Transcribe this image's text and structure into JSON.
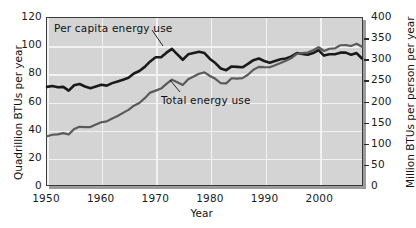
{
  "chart_data": {
    "type": "line",
    "title": "",
    "xlabel": "Year",
    "ylabel_left": "Quadrillion BTUs per year",
    "ylabel_right": "Million BTUs per person per year",
    "grid": true,
    "legend_position": "inline-annotations",
    "xlim": [
      1950,
      2008
    ],
    "xticks": [
      1950,
      1960,
      1970,
      1980,
      1990,
      2000
    ],
    "ylim_left": [
      0,
      120
    ],
    "yticks_left": [
      0,
      20,
      40,
      60,
      80,
      100,
      120
    ],
    "ylim_right": [
      0,
      400
    ],
    "yticks_right": [
      0,
      50,
      100,
      150,
      200,
      250,
      300,
      350,
      400
    ],
    "annotations": [
      {
        "text": "Per capita energy use",
        "series": "per_capita_energy_use"
      },
      {
        "text": "Total energy use",
        "series": "total_energy_use"
      }
    ],
    "x": [
      1950,
      1951,
      1952,
      1953,
      1954,
      1955,
      1956,
      1957,
      1958,
      1959,
      1960,
      1961,
      1962,
      1963,
      1964,
      1965,
      1966,
      1967,
      1968,
      1969,
      1970,
      1971,
      1972,
      1973,
      1974,
      1975,
      1976,
      1977,
      1978,
      1979,
      1980,
      1981,
      1982,
      1983,
      1984,
      1985,
      1986,
      1987,
      1988,
      1989,
      1990,
      1991,
      1992,
      1993,
      1994,
      1995,
      1996,
      1997,
      1998,
      1999,
      2000,
      2001,
      2002,
      2003,
      2004,
      2005,
      2006,
      2007,
      2008
    ],
    "series": [
      {
        "name": "per_capita_energy_use",
        "axis": "right",
        "units": "Million BTUs per person per year",
        "color": "#1a1a1a",
        "values": [
          235,
          237,
          234,
          235,
          226,
          239,
          242,
          236,
          232,
          236,
          240,
          238,
          244,
          248,
          252,
          257,
          267,
          273,
          283,
          296,
          306,
          306,
          317,
          326,
          313,
          300,
          313,
          316,
          319,
          316,
          302,
          292,
          279,
          275,
          284,
          283,
          282,
          290,
          299,
          303,
          297,
          293,
          297,
          301,
          303,
          308,
          316,
          314,
          312,
          316,
          323,
          310,
          313,
          313,
          317,
          317,
          312,
          316,
          303
        ]
      },
      {
        "name": "total_energy_use",
        "axis": "left",
        "units": "Quadrillion BTUs per year",
        "color": "#5a5a5a",
        "values": [
          35.0,
          36.1,
          36.4,
          37.3,
          36.3,
          40.2,
          41.8,
          41.6,
          41.6,
          43.5,
          45.1,
          45.7,
          47.8,
          49.6,
          51.8,
          54.0,
          57.0,
          58.9,
          62.4,
          66.4,
          67.8,
          69.3,
          72.7,
          75.7,
          73.9,
          71.9,
          76.0,
          77.9,
          79.9,
          80.9,
          78.3,
          76.3,
          73.1,
          73.0,
          76.7,
          76.5,
          76.8,
          79.2,
          82.8,
          84.9,
          84.7,
          84.6,
          86.0,
          87.6,
          89.3,
          91.2,
          94.2,
          94.8,
          95.2,
          96.8,
          99.0,
          96.3,
          97.9,
          98.2,
          100.4,
          100.5,
          99.9,
          101.5,
          99.3
        ]
      }
    ]
  }
}
